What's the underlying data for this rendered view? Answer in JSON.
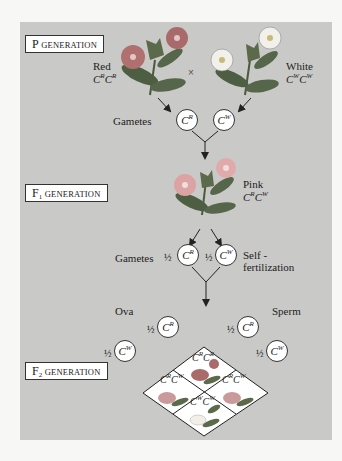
{
  "diagram": {
    "panel_color": "#c9c9c7",
    "p_generation": {
      "box_label_first": "P",
      "box_label_rest": "GENERATION",
      "parent_left": {
        "phenotype": "Red",
        "genotype_base": "C",
        "allele": "R",
        "flower_color": "#b26a6a"
      },
      "cross_symbol": "×",
      "parent_right": {
        "phenotype": "White",
        "genotype_base": "C",
        "allele": "W",
        "flower_color": "#f2f0ea"
      },
      "gametes_label": "Gametes",
      "gametes": [
        {
          "base": "C",
          "allele": "R"
        },
        {
          "base": "C",
          "allele": "W"
        }
      ]
    },
    "f1_generation": {
      "box_label_first": "F",
      "box_label_sub": "1",
      "box_label_rest": "GENERATION",
      "phenotype": "Pink",
      "genotype": "CRCW",
      "flower_color": "#dba3a3",
      "gametes_label": "Gametes",
      "gametes": [
        {
          "fraction": "½",
          "base": "C",
          "allele": "R"
        },
        {
          "fraction": "½",
          "base": "C",
          "allele": "W"
        }
      ],
      "self_label_line1": "Self -",
      "self_label_line2": "fertilization"
    },
    "f2_generation": {
      "box_label_first": "F",
      "box_label_sub": "2",
      "box_label_rest": "GENERATION",
      "ova_label": "Ova",
      "sperm_label": "Sperm",
      "ova": [
        {
          "fraction": "½",
          "base": "C",
          "allele": "R"
        },
        {
          "fraction": "½",
          "base": "C",
          "allele": "W"
        }
      ],
      "sperm": [
        {
          "fraction": "½",
          "base": "C",
          "allele": "R"
        },
        {
          "fraction": "½",
          "base": "C",
          "allele": "W"
        }
      ],
      "grid": [
        {
          "position": "top",
          "genotype": "CRCR",
          "a1": "R",
          "a2": "R",
          "phenotype_color": "#a96a6a"
        },
        {
          "position": "left",
          "genotype": "CRCW",
          "a1": "R",
          "a2": "W",
          "phenotype_color": "#c99a9a"
        },
        {
          "position": "right",
          "genotype": "CRCW",
          "a1": "R",
          "a2": "W",
          "phenotype_color": "#c99a9a"
        },
        {
          "position": "bottom",
          "genotype": "CWCW",
          "a1": "W",
          "a2": "W",
          "phenotype_color": "#f1efe8"
        }
      ]
    }
  }
}
